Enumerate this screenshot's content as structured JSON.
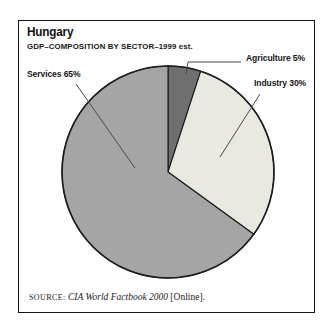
{
  "chart_data": {
    "type": "pie",
    "title": "Hungary",
    "subtitle": "GDP–COMPOSITION BY SECTOR–1999 est.",
    "start_angle_deg": 0,
    "direction": "clockwise",
    "slices": [
      {
        "label": "Agriculture",
        "value_pct": 5,
        "display": "Agriculture 5%",
        "color": "#6f6f6f"
      },
      {
        "label": "Industry",
        "value_pct": 30,
        "display": "Industry 30%",
        "color": "#e9e8e1"
      },
      {
        "label": "Services",
        "value_pct": 65,
        "display": "Services 65%",
        "color": "#a5a5a5"
      }
    ],
    "outline_color": "#1c1c1c",
    "leader_line_color": "#4a4a4a",
    "source_parts": {
      "prefix": "SOURCE:",
      "work": "CIA World Factbook 2000",
      "suffix": "[Online]."
    }
  }
}
